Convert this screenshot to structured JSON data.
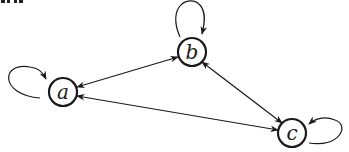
{
  "diagram": {
    "type": "directed-graph",
    "cropped_header_fragment": "",
    "colors": {
      "stroke": "#1a1a1a",
      "background": "#ffffff"
    },
    "nodes": [
      {
        "id": "a",
        "label": "a",
        "x": 63,
        "y": 92,
        "r": 14
      },
      {
        "id": "b",
        "label": "b",
        "x": 192,
        "y": 52,
        "r": 14
      },
      {
        "id": "c",
        "label": "c",
        "x": 292,
        "y": 133,
        "r": 14
      }
    ],
    "edges": [
      {
        "from": "a",
        "to": "b",
        "bidirectional": true
      },
      {
        "from": "c",
        "to": "a",
        "bidirectional": true
      },
      {
        "from": "b",
        "to": "c",
        "bidirectional": true
      },
      {
        "from": "a",
        "to": "a",
        "self_loop": true,
        "side": "left"
      },
      {
        "from": "b",
        "to": "b",
        "self_loop": true,
        "side": "top"
      },
      {
        "from": "c",
        "to": "c",
        "self_loop": true,
        "side": "right"
      }
    ]
  }
}
